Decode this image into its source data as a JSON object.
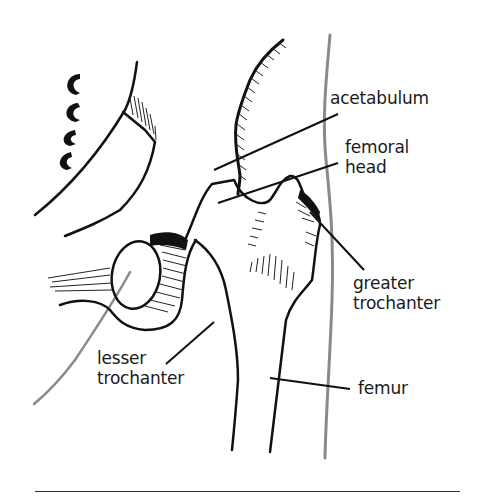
{
  "diagram": {
    "labels": {
      "acetabulum": "acetabulum",
      "femoral_head": "femoral\nhead",
      "greater_trochanter": "greater\ntrochanter",
      "lesser_trochanter": "lesser\ntrochanter",
      "femur": "femur"
    },
    "colors": {
      "ink": "#111111",
      "outline_grey": "#8a8a8a",
      "background": "#ffffff"
    }
  }
}
